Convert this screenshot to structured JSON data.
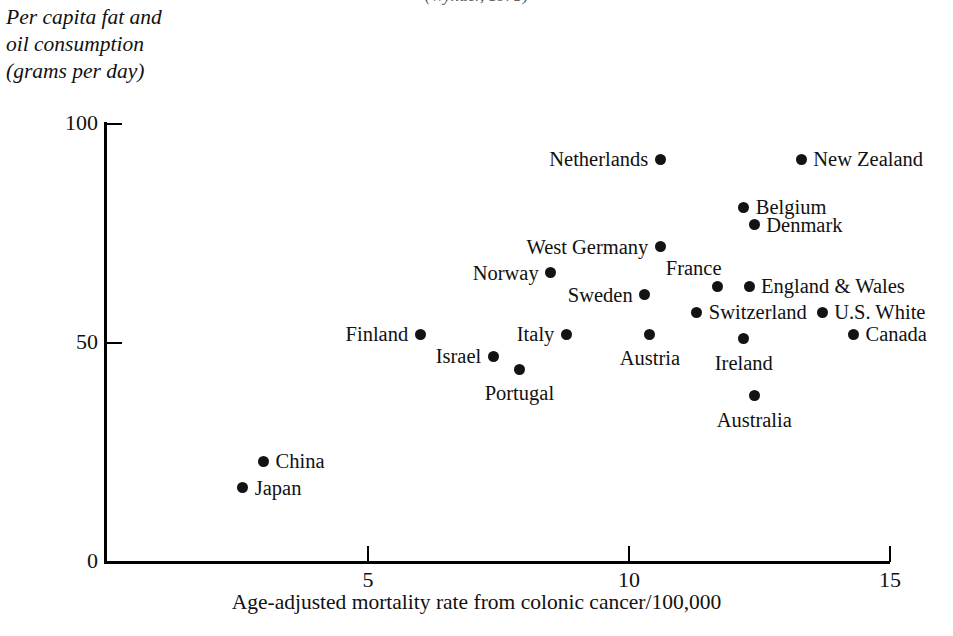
{
  "source_line": "(Wynder, 1975)",
  "chart_data": {
    "type": "scatter",
    "title": "",
    "xlabel": "Age-adjusted mortality rate from colonic cancer/100,000",
    "ylabel_lines": [
      "Per capita fat and",
      "oil consumption",
      "(grams per day)"
    ],
    "ylabel": "Per capita fat and oil consumption (grams per day)",
    "xlim": [
      0,
      15
    ],
    "ylim": [
      0,
      100
    ],
    "xticks": [
      "5",
      "10",
      "15"
    ],
    "xtick_values": [
      5,
      10,
      15
    ],
    "yticks": [
      "100",
      "50",
      "0"
    ],
    "ytick_values": [
      100,
      50,
      0
    ],
    "grid": false,
    "legend": "none",
    "marker": "filled-circle",
    "points": [
      {
        "label": "Netherlands",
        "x": 10.6,
        "y": 92,
        "label_side": "left"
      },
      {
        "label": "New Zealand",
        "x": 13.3,
        "y": 92,
        "label_side": "right"
      },
      {
        "label": "Belgium",
        "x": 12.2,
        "y": 81,
        "label_side": "right"
      },
      {
        "label": "Denmark",
        "x": 12.4,
        "y": 77,
        "label_side": "right"
      },
      {
        "label": "West Germany",
        "x": 10.6,
        "y": 72,
        "label_side": "left"
      },
      {
        "label": "Norway",
        "x": 8.5,
        "y": 66,
        "label_side": "left"
      },
      {
        "label": "France",
        "x": 11.7,
        "y": 63,
        "label_side": "above"
      },
      {
        "label": "England & Wales",
        "x": 12.3,
        "y": 63,
        "label_side": "right"
      },
      {
        "label": "Sweden",
        "x": 10.3,
        "y": 61,
        "label_side": "left"
      },
      {
        "label": "Switzerland",
        "x": 11.3,
        "y": 57,
        "label_side": "right"
      },
      {
        "label": "U.S. White",
        "x": 13.7,
        "y": 57,
        "label_side": "right"
      },
      {
        "label": "Finland",
        "x": 6.0,
        "y": 52,
        "label_side": "left"
      },
      {
        "label": "Italy",
        "x": 8.8,
        "y": 52,
        "label_side": "left"
      },
      {
        "label": "Austria",
        "x": 10.4,
        "y": 52,
        "label_side": "below"
      },
      {
        "label": "Canada",
        "x": 14.3,
        "y": 52,
        "label_side": "right"
      },
      {
        "label": "Ireland",
        "x": 12.2,
        "y": 51,
        "label_side": "below"
      },
      {
        "label": "Israel",
        "x": 7.4,
        "y": 47,
        "label_side": "left"
      },
      {
        "label": "Portugal",
        "x": 7.9,
        "y": 44,
        "label_side": "below"
      },
      {
        "label": "Australia",
        "x": 12.4,
        "y": 38,
        "label_side": "below"
      },
      {
        "label": "China",
        "x": 3.0,
        "y": 23,
        "label_side": "right"
      },
      {
        "label": "Japan",
        "x": 2.6,
        "y": 17,
        "label_side": "right"
      }
    ]
  }
}
